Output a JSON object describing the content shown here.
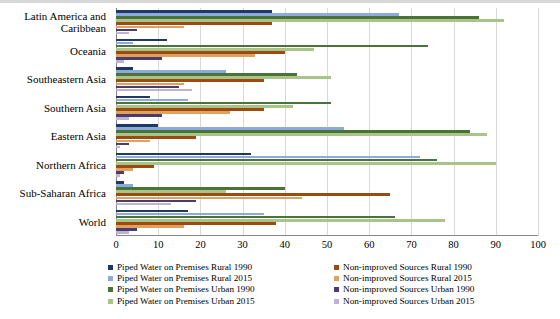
{
  "chart_data": {
    "type": "bar",
    "orientation": "horizontal",
    "title": "",
    "xlabel": "",
    "ylabel": "",
    "xlim": [
      0,
      100
    ],
    "xticks": [
      0,
      10,
      20,
      30,
      40,
      50,
      60,
      70,
      80,
      90,
      100
    ],
    "grid": true,
    "legend_position": "bottom",
    "categories": [
      "Latin America and Caribbean",
      "Oceania",
      "Southeastern Asia",
      "Southern Asia",
      "Eastern Asia",
      "Northern Africa",
      "Sub-Saharan Africa",
      "World"
    ],
    "series": [
      {
        "name": "Piped Water on Premises Rural 1990",
        "color": "#1F3864",
        "values": [
          37,
          12,
          4,
          8,
          10,
          32,
          2,
          17
        ]
      },
      {
        "name": "Piped Water on Premises Rural 2015",
        "color": "#8EA9DB",
        "values": [
          67,
          4,
          26,
          17,
          54,
          72,
          4,
          35
        ]
      },
      {
        "name": "Piped Water on Premises Urban 1990",
        "color": "#4A7337",
        "values": [
          86,
          74,
          43,
          51,
          84,
          76,
          40,
          66
        ]
      },
      {
        "name": "Piped Water on Premises Urban 2015",
        "color": "#A9C48A",
        "values": [
          92,
          47,
          51,
          42,
          88,
          90,
          26,
          78
        ]
      },
      {
        "name": "Non-improved Sources Rural 1990",
        "color": "#9C4A10",
        "values": [
          37,
          40,
          35,
          35,
          19,
          9,
          65,
          38
        ]
      },
      {
        "name": "Non-improved Sources Rural 2015",
        "color": "#E0A060",
        "values": [
          16,
          33,
          16,
          27,
          8,
          4,
          44,
          16
        ]
      },
      {
        "name": "Non-improved Sources Urban 1990",
        "color": "#4A3C6B",
        "values": [
          5,
          11,
          15,
          11,
          3,
          2,
          19,
          5
        ]
      },
      {
        "name": "Non-improved Sources Urban 2015",
        "color": "#BFB3D4",
        "values": [
          3,
          2,
          18,
          3,
          1,
          1,
          13,
          3
        ]
      }
    ]
  }
}
